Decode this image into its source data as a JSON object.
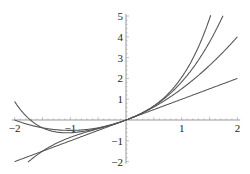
{
  "chart_data": {
    "type": "line",
    "title": "",
    "xlabel": "",
    "ylabel": "",
    "xlim": [
      -2,
      2
    ],
    "ylim": [
      -2,
      5
    ],
    "grid": false,
    "legend": "none",
    "x_ticks": [
      "-2",
      "-1",
      "1",
      "2"
    ],
    "y_ticks": [
      "-2",
      "-1",
      "1",
      "2",
      "3",
      "4",
      "5"
    ],
    "x": [
      -2,
      -1.5,
      -1,
      -0.5,
      0,
      0.5,
      1,
      1.5,
      2
    ],
    "series": [
      {
        "name": "P1",
        "values": [
          -2,
          -1.5,
          -1,
          -0.5,
          0,
          0.5,
          1,
          1.5,
          2
        ]
      },
      {
        "name": "P2",
        "values": [
          0,
          -0.375,
          -0.5,
          -0.375,
          0,
          0.625,
          1.5,
          2.625,
          4
        ]
      },
      {
        "name": "P3",
        "values": [
          null,
          -1.6,
          -0.75,
          -0.4,
          0,
          0.65,
          1.75,
          3.5,
          null
        ]
      },
      {
        "name": "P4",
        "values": [
          1.39,
          -0.2,
          -0.55,
          -0.38,
          0,
          0.66,
          1.9,
          4.9,
          null
        ]
      }
    ]
  },
  "axes": {
    "x_labels": [
      {
        "v": -2,
        "t": "-2"
      },
      {
        "v": -1,
        "t": "-1"
      },
      {
        "v": 1,
        "t": "1"
      },
      {
        "v": 2,
        "t": "2"
      }
    ],
    "y_labels": [
      {
        "v": -2,
        "t": "-2"
      },
      {
        "v": -1,
        "t": "-1"
      },
      {
        "v": 1,
        "t": "1"
      },
      {
        "v": 2,
        "t": "2"
      },
      {
        "v": 3,
        "t": "3"
      },
      {
        "v": 4,
        "t": "4"
      },
      {
        "v": 5,
        "t": "5"
      }
    ]
  },
  "colors": {
    "curve": "#555555",
    "axis": "#999999"
  }
}
